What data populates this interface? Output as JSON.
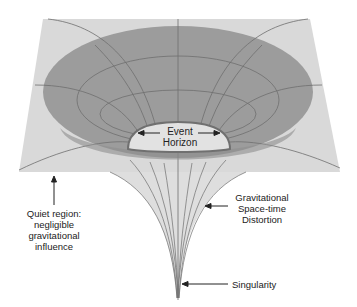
{
  "diagram": {
    "colors": {
      "background": "#ffffff",
      "plane": "#d8d8d8",
      "bowl": "#9c9c9c",
      "bowl_dark": "#8e8e8e",
      "horizon_fill": "#e2e2e2",
      "horizon_stroke": "#707070",
      "grid_lines": "#6e6e6e",
      "funnel": "#dadada",
      "text": "#222222",
      "arrow": "#222222"
    },
    "labels": {
      "event_horizon": [
        "Event",
        "Horizon"
      ],
      "quiet_region": [
        "Quiet region:",
        "negligible",
        "gravitational",
        "influence"
      ],
      "distortion": [
        "Gravitational",
        "Space-time",
        "Distortion"
      ],
      "singularity": "Singularity"
    }
  }
}
